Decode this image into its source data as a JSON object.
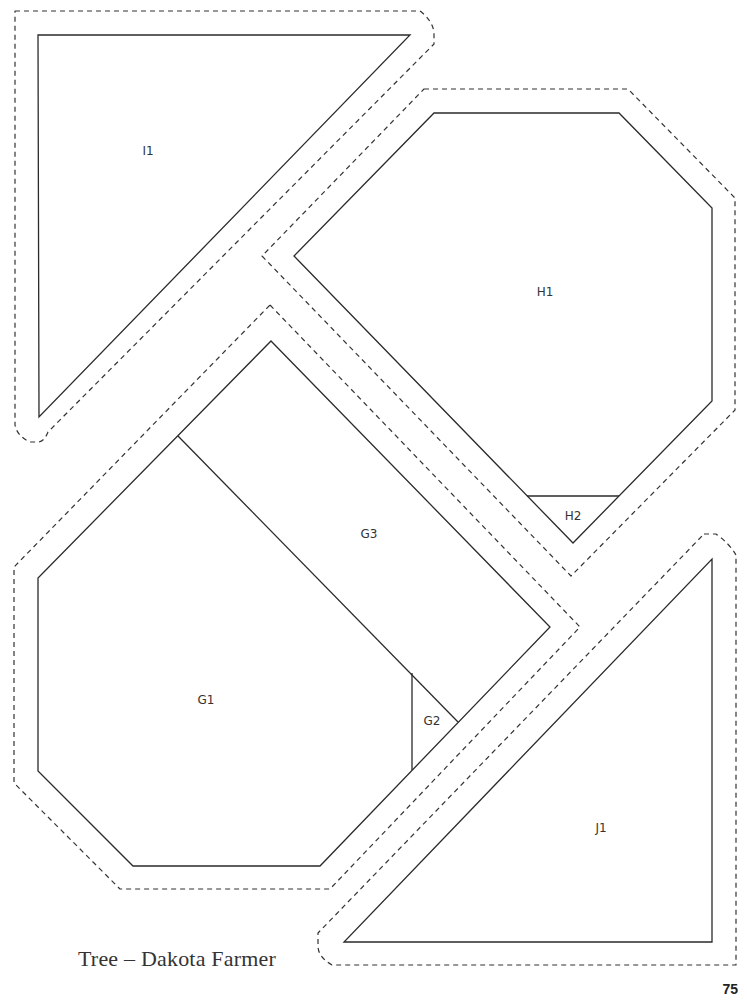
{
  "page": {
    "title": "Tree – Dakota Farmer",
    "page_number": "75"
  },
  "pieces": [
    {
      "id": "I1",
      "label": "I1",
      "x": 148,
      "y": 151
    },
    {
      "id": "H1",
      "label": "H1",
      "x": 545,
      "y": 292
    },
    {
      "id": "H2",
      "label": "H2",
      "x": 573,
      "y": 516
    },
    {
      "id": "G3",
      "label": "G3",
      "x": 369,
      "y": 534
    },
    {
      "id": "G1",
      "label": "G1",
      "x": 206,
      "y": 700
    },
    {
      "id": "G2",
      "label": "G2",
      "x": 432,
      "y": 721
    },
    {
      "id": "J1",
      "label": "J1",
      "x": 601,
      "y": 828
    }
  ],
  "colors": {
    "line": "#2a2a2a",
    "background": "#ffffff"
  }
}
